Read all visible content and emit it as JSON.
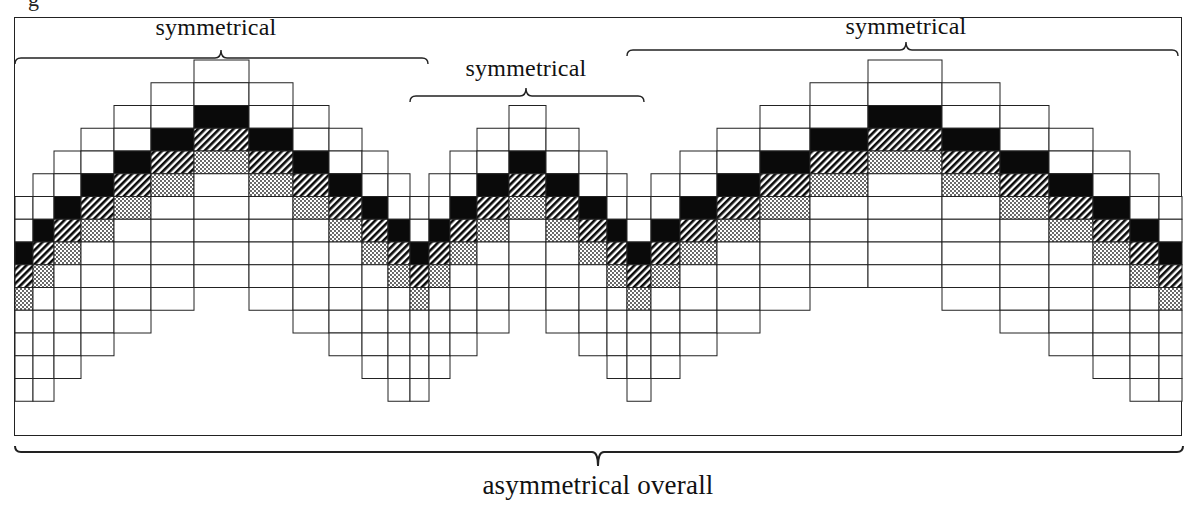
{
  "figure": {
    "caption_fragment": "g",
    "labels": {
      "section_1": "symmetrical",
      "section_2": "symmetrical",
      "section_3": "symmetrical",
      "overall": "asymmetrical overall"
    },
    "colors": {
      "line": "#222222",
      "solid": "#0a0a0a",
      "background": "#ffffff"
    },
    "legend_fill_order": [
      "white",
      "white",
      "black",
      "hatched",
      "dotted",
      "white",
      "white",
      "white",
      "white",
      "white"
    ],
    "grid": {
      "row_height": 22.75,
      "origin_y": 60,
      "columns": [
        {
          "x0": 15,
          "x1": 33,
          "top": 6,
          "rows": 9
        },
        {
          "x0": 33,
          "x1": 54,
          "top": 5,
          "rows": 10
        },
        {
          "x0": 54,
          "x1": 81,
          "top": 4,
          "rows": 10
        },
        {
          "x0": 81,
          "x1": 114,
          "top": 3,
          "rows": 10
        },
        {
          "x0": 114,
          "x1": 151,
          "top": 2,
          "rows": 10
        },
        {
          "x0": 151,
          "x1": 194,
          "top": 1,
          "rows": 10
        },
        {
          "x0": 194,
          "x1": 249,
          "top": 0,
          "rows": 10
        },
        {
          "x0": 249,
          "x1": 293,
          "top": 1,
          "rows": 10
        },
        {
          "x0": 293,
          "x1": 329,
          "top": 2,
          "rows": 10
        },
        {
          "x0": 329,
          "x1": 362,
          "top": 3,
          "rows": 10
        },
        {
          "x0": 362,
          "x1": 388,
          "top": 4,
          "rows": 10
        },
        {
          "x0": 388,
          "x1": 410,
          "top": 5,
          "rows": 10
        },
        {
          "x0": 410,
          "x1": 429,
          "top": 6,
          "rows": 9
        },
        {
          "x0": 429,
          "x1": 450,
          "top": 5,
          "rows": 9
        },
        {
          "x0": 450,
          "x1": 477,
          "top": 4,
          "rows": 9
        },
        {
          "x0": 477,
          "x1": 509,
          "top": 3,
          "rows": 9
        },
        {
          "x0": 509,
          "x1": 546,
          "top": 2,
          "rows": 9
        },
        {
          "x0": 546,
          "x1": 579,
          "top": 3,
          "rows": 9
        },
        {
          "x0": 579,
          "x1": 607,
          "top": 4,
          "rows": 9
        },
        {
          "x0": 607,
          "x1": 627,
          "top": 5,
          "rows": 9
        },
        {
          "x0": 627,
          "x1": 651,
          "top": 6,
          "rows": 9
        },
        {
          "x0": 651,
          "x1": 680,
          "top": 5,
          "rows": 9
        },
        {
          "x0": 680,
          "x1": 717,
          "top": 4,
          "rows": 9
        },
        {
          "x0": 717,
          "x1": 760,
          "top": 3,
          "rows": 9
        },
        {
          "x0": 760,
          "x1": 810,
          "top": 2,
          "rows": 9
        },
        {
          "x0": 810,
          "x1": 868,
          "top": 1,
          "rows": 9
        },
        {
          "x0": 868,
          "x1": 942,
          "top": 0,
          "rows": 10
        },
        {
          "x0": 942,
          "x1": 1000,
          "top": 1,
          "rows": 10
        },
        {
          "x0": 1000,
          "x1": 1049,
          "top": 2,
          "rows": 10
        },
        {
          "x0": 1049,
          "x1": 1093,
          "top": 3,
          "rows": 10
        },
        {
          "x0": 1093,
          "x1": 1130,
          "top": 4,
          "rows": 10
        },
        {
          "x0": 1130,
          "x1": 1159,
          "top": 5,
          "rows": 10
        },
        {
          "x0": 1159,
          "x1": 1182,
          "top": 6,
          "rows": 9
        }
      ]
    },
    "braces": [
      {
        "name": "section-1",
        "x0": 15,
        "x1": 428,
        "y": 58,
        "direction": "up",
        "tip_x": 221
      },
      {
        "name": "section-2",
        "x0": 410,
        "x1": 644,
        "y": 96,
        "direction": "up",
        "tip_x": 526
      },
      {
        "name": "section-3",
        "x0": 627,
        "x1": 1178,
        "y": 50,
        "direction": "up",
        "tip_x": 906
      },
      {
        "name": "overall",
        "x0": 15,
        "x1": 1183,
        "y": 452,
        "direction": "down",
        "tip_x": 598
      }
    ]
  }
}
